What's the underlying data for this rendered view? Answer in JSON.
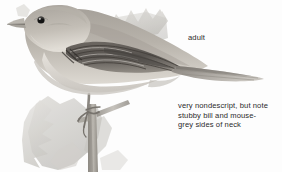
{
  "plate": {
    "subject": "warbler-perched-on-branch",
    "background_color": "#fdfdfd"
  },
  "labels": {
    "adult": "adult",
    "note": "very nondescript, but note\nstubby bill and mouse-\ngrey sides of neck"
  },
  "palette": {
    "text": "#2b2b2b",
    "eye": "#141414",
    "upperpart_grey": "#9a958e",
    "wing_dark": "#4e4a46",
    "underpart_pale": "#d9d5ce",
    "foliage_grey": "#cfcdc8",
    "branch_grey": "#a8a49d"
  },
  "illustration": {
    "elements": [
      "background-foliage-upper",
      "background-foliage-lower",
      "bird-body",
      "bird-head",
      "bird-bill",
      "bird-eye",
      "bird-wing",
      "bird-tail",
      "bird-leg",
      "perch-branch"
    ]
  }
}
